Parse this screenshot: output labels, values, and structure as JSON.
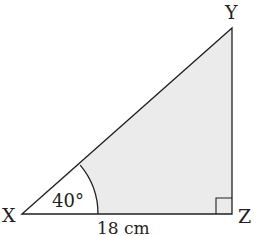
{
  "diagram": {
    "type": "right-triangle",
    "vertices": {
      "X": "X",
      "Y": "Y",
      "Z": "Z"
    },
    "angle_label": "40°",
    "base_label": "18 cm",
    "right_angle_at": "Z",
    "colors": {
      "stroke": "#231f20",
      "fill": "#ebebeb",
      "arc_sector_fill": "#ffffff"
    }
  }
}
